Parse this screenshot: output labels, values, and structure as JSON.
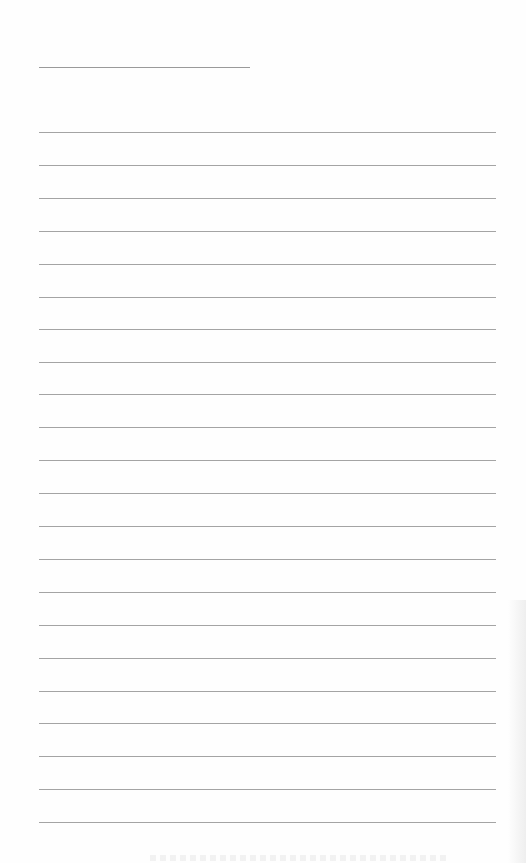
{
  "page": {
    "type": "blank lined writing paper",
    "background_color": "#fefefe",
    "line_color": "#a4a4a4",
    "heading_line": {
      "y": 67,
      "x_start": 39,
      "x_end": 250
    },
    "ruled_lines": {
      "count": 22,
      "x_start": 39,
      "x_end": 496,
      "y_positions": [
        132,
        165,
        198,
        231,
        264,
        297,
        329,
        362,
        394,
        427,
        460,
        493,
        526,
        559,
        592,
        625,
        658,
        691,
        723,
        756,
        789,
        822
      ]
    },
    "text_content": []
  }
}
